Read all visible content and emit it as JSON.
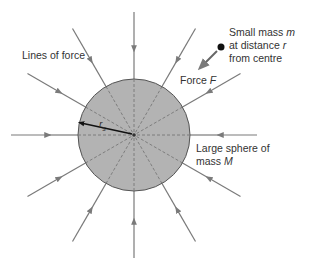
{
  "diagram": {
    "sphere": {
      "cx": 134,
      "cy": 135,
      "r": 56,
      "fill": "#b3b3b3",
      "stroke": "#555555"
    },
    "field_lines": {
      "count": 12,
      "angle_step_deg": 30,
      "outer_radius": 123,
      "color": "#7a7a7a",
      "direction": "inward"
    },
    "labels": {
      "lines_of_force": "Lines of force",
      "small_mass_line1": "Small mass ",
      "small_mass_m": "m",
      "small_mass_line2": "at distance ",
      "small_mass_r": "r",
      "small_mass_line3": "from centre",
      "force": "Force ",
      "force_F": "F",
      "sphere_line1": "Large sphere of",
      "sphere_line2": "mass ",
      "sphere_M": "M",
      "radius": "r",
      "radius_sub": "s"
    },
    "small_mass": {
      "cx": 221,
      "cy": 47,
      "r": 3.5,
      "color": "#111111"
    }
  }
}
